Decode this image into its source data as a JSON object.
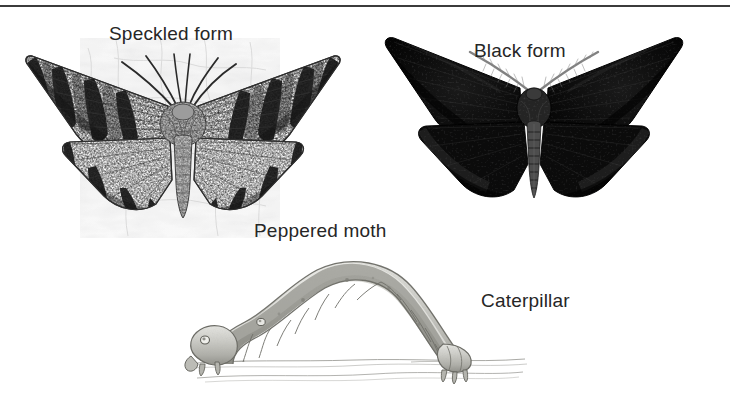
{
  "figure": {
    "type": "scientific-illustration",
    "background_color": "#ffffff",
    "text_color": "#262626",
    "rule_color": "#3b3b3b",
    "width": 730,
    "height": 414
  },
  "labels": {
    "speckled_form": "Speckled form",
    "black_form": "Black form",
    "peppered_moth": "Peppered moth",
    "caterpillar": "Caterpillar"
  },
  "illustrations": {
    "speckled_moth": {
      "name": "speckled-form-moth-illustration",
      "description": "Pale mottled peppered moth with wings spread, resting on lichen-covered bark",
      "wing_tone": "#f2f2f2",
      "marking_tone": "#1c1c1c",
      "body_tone": "#8a8a8a",
      "background_tone": "#e9e9e9"
    },
    "black_moth": {
      "name": "black-form-moth-illustration",
      "description": "Melanic carbonaria peppered moth with wings spread, uniformly dark",
      "wing_tone": "#0a0a0a",
      "body_tone": "#2a2a2a",
      "antenna_tone": "#6f6f6f"
    },
    "caterpillar": {
      "name": "caterpillar-illustration",
      "description": "Looper caterpillar arched over a twig, pale grey-green twig-mimic body",
      "body_tone": "#c9c9c4",
      "outline_tone": "#6d6d68",
      "ground_tone": "#9a9a96"
    }
  }
}
